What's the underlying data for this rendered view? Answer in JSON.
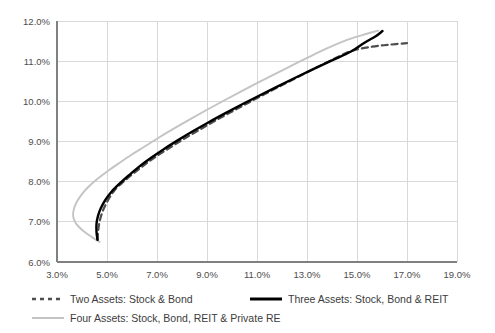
{
  "chart_data": {
    "type": "line",
    "title": "",
    "subtitle": "",
    "xlabel": "",
    "ylabel": "",
    "xlim": [
      3.0,
      19.0
    ],
    "ylim": [
      6.0,
      12.0
    ],
    "grid": true,
    "legend_position": "bottom",
    "xtick_labels": [
      "3.0%",
      "5.0%",
      "7.0%",
      "9.0%",
      "11.0%",
      "13.0%",
      "15.0%",
      "17.0%",
      "19.0%"
    ],
    "xtick_values": [
      3.0,
      5.0,
      7.0,
      9.0,
      11.0,
      13.0,
      15.0,
      17.0,
      19.0
    ],
    "ytick_labels": [
      "6.0%",
      "7.0%",
      "8.0%",
      "9.0%",
      "10.0%",
      "11.0%",
      "12.0%"
    ],
    "ytick_values": [
      6.0,
      7.0,
      8.0,
      9.0,
      10.0,
      11.0,
      12.0
    ],
    "series": [
      {
        "name": "Two Assets: Stock & Bond",
        "style": "dashed",
        "color": "#4d4d4d",
        "points": [
          [
            4.62,
            6.55
          ],
          [
            4.65,
            6.8
          ],
          [
            4.72,
            7.05
          ],
          [
            4.85,
            7.3
          ],
          [
            5.05,
            7.55
          ],
          [
            5.32,
            7.8
          ],
          [
            5.66,
            8.0
          ],
          [
            6.05,
            8.2
          ],
          [
            6.5,
            8.42
          ],
          [
            7.0,
            8.64
          ],
          [
            7.55,
            8.86
          ],
          [
            8.12,
            9.08
          ],
          [
            8.72,
            9.3
          ],
          [
            9.34,
            9.52
          ],
          [
            9.98,
            9.74
          ],
          [
            10.64,
            9.96
          ],
          [
            11.31,
            10.18
          ],
          [
            11.99,
            10.4
          ],
          [
            12.68,
            10.62
          ],
          [
            13.38,
            10.84
          ],
          [
            14.09,
            11.06
          ],
          [
            14.81,
            11.26
          ],
          [
            15.6,
            11.36
          ],
          [
            16.3,
            11.41
          ],
          [
            17.0,
            11.45
          ]
        ]
      },
      {
        "name": "Three Assets: Stock, Bond & REIT",
        "style": "solid",
        "color": "#000000",
        "points": [
          [
            4.62,
            6.55
          ],
          [
            4.58,
            6.75
          ],
          [
            4.58,
            6.95
          ],
          [
            4.64,
            7.15
          ],
          [
            4.76,
            7.35
          ],
          [
            4.94,
            7.55
          ],
          [
            5.18,
            7.75
          ],
          [
            5.5,
            7.95
          ],
          [
            5.88,
            8.16
          ],
          [
            6.3,
            8.38
          ],
          [
            6.78,
            8.6
          ],
          [
            7.3,
            8.82
          ],
          [
            7.86,
            9.04
          ],
          [
            8.45,
            9.26
          ],
          [
            9.07,
            9.48
          ],
          [
            9.72,
            9.7
          ],
          [
            10.39,
            9.92
          ],
          [
            11.08,
            10.14
          ],
          [
            11.79,
            10.36
          ],
          [
            12.51,
            10.58
          ],
          [
            13.25,
            10.8
          ],
          [
            14.0,
            11.02
          ],
          [
            14.76,
            11.24
          ],
          [
            15.3,
            11.46
          ],
          [
            15.75,
            11.62
          ],
          [
            16.02,
            11.75
          ]
        ]
      },
      {
        "name": "Four Assets: Stock, Bond, REIT & Private RE",
        "style": "solid",
        "color": "#c4c4c4",
        "points": [
          [
            4.7,
            6.5
          ],
          [
            4.4,
            6.62
          ],
          [
            4.12,
            6.74
          ],
          [
            3.9,
            6.86
          ],
          [
            3.74,
            6.98
          ],
          [
            3.65,
            7.12
          ],
          [
            3.66,
            7.28
          ],
          [
            3.76,
            7.46
          ],
          [
            3.96,
            7.66
          ],
          [
            4.24,
            7.86
          ],
          [
            4.6,
            8.06
          ],
          [
            5.02,
            8.26
          ],
          [
            5.48,
            8.46
          ],
          [
            5.98,
            8.67
          ],
          [
            6.52,
            8.88
          ],
          [
            7.08,
            9.1
          ],
          [
            7.67,
            9.32
          ],
          [
            8.28,
            9.54
          ],
          [
            8.91,
            9.76
          ],
          [
            9.56,
            9.98
          ],
          [
            10.22,
            10.2
          ],
          [
            10.9,
            10.42
          ],
          [
            11.59,
            10.64
          ],
          [
            12.29,
            10.86
          ],
          [
            13.0,
            11.08
          ],
          [
            13.73,
            11.3
          ],
          [
            14.48,
            11.5
          ],
          [
            15.22,
            11.65
          ],
          [
            15.85,
            11.76
          ]
        ]
      }
    ]
  },
  "legend": {
    "items": [
      {
        "label": "Two Assets: Stock & Bond",
        "style": "dashed",
        "color": "#4d4d4d"
      },
      {
        "label": "Three Assets: Stock, Bond & REIT",
        "style": "solid",
        "color": "#000000"
      },
      {
        "label": "Four Assets: Stock, Bond, REIT & Private RE",
        "style": "solid",
        "color": "#c4c4c4"
      }
    ]
  },
  "colors": {
    "grid": "#d9d9d9",
    "axis": "#808080",
    "text": "#4d4d4d",
    "background": "#ffffff"
  }
}
